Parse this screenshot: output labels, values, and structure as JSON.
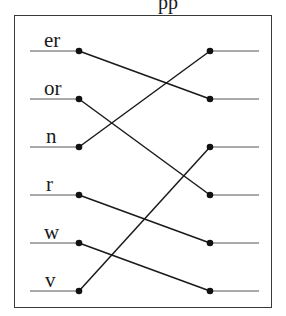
{
  "title_fragment": "pp",
  "left_items": [
    {
      "label": "er",
      "y": 51
    },
    {
      "label": "or",
      "y": 99
    },
    {
      "label": "n",
      "y": 147
    },
    {
      "label": "r",
      "y": 195
    },
    {
      "label": "w",
      "y": 243
    },
    {
      "label": "v",
      "y": 291
    }
  ],
  "right_slots": [
    51,
    99,
    147,
    195,
    243,
    291
  ],
  "connections": [
    {
      "from": 0,
      "to": 1
    },
    {
      "from": 1,
      "to": 3
    },
    {
      "from": 2,
      "to": 0
    },
    {
      "from": 3,
      "to": 4
    },
    {
      "from": 4,
      "to": 5
    },
    {
      "from": 5,
      "to": 2
    }
  ],
  "colors": {
    "line": "#1a1a1a",
    "stub": "#8c8c8c",
    "dot": "#111111",
    "frame": "#3a3a3a"
  }
}
